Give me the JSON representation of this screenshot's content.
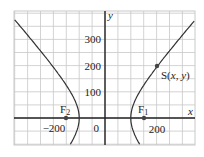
{
  "axes": {
    "x_label": "x",
    "y_label": "y",
    "x_ticks": [
      {
        "value": -200,
        "label": "−200"
      },
      {
        "value": 0,
        "label": "0"
      },
      {
        "value": 200,
        "label": "200"
      }
    ],
    "y_ticks": [
      {
        "value": 100,
        "label": "100"
      },
      {
        "value": 200,
        "label": "200"
      },
      {
        "value": 300,
        "label": "300"
      }
    ],
    "grid_step": 50,
    "x_range": [
      -350,
      350
    ],
    "y_range": [
      -100,
      400
    ]
  },
  "curve": {
    "type": "hyperbola",
    "equation": "x^2/100^2 - y^2/(111.8)^2 = 1",
    "a": 100,
    "b": 111.8,
    "c": 150
  },
  "points": {
    "F1": {
      "label_main": "F",
      "label_sub": "1",
      "x": 150,
      "y": 0
    },
    "F2": {
      "label_main": "F",
      "label_sub": "2",
      "x": -150,
      "y": 0
    },
    "S": {
      "label": "S(x, y)",
      "x": 205,
      "y": 200
    }
  },
  "colors": {
    "grid": "#c8c8c8",
    "axis": "#222222",
    "curve": "#333333",
    "point": "#444444"
  }
}
